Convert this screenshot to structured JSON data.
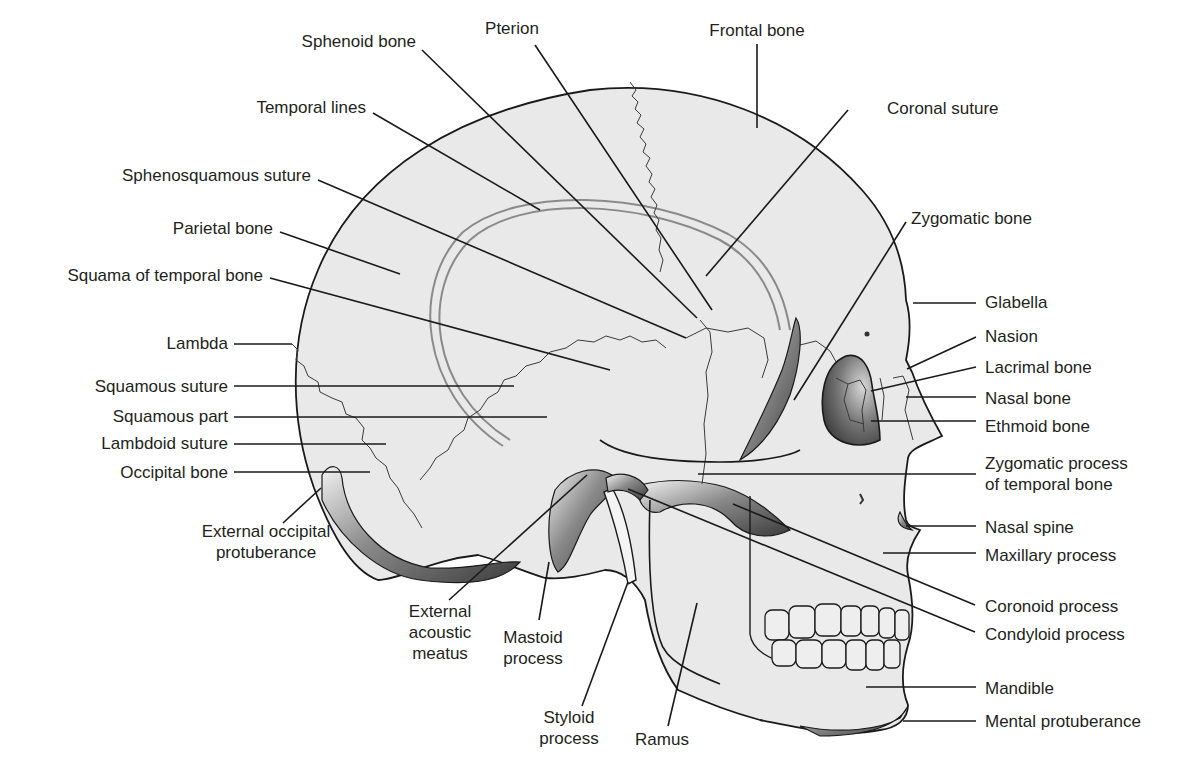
{
  "diagram": {
    "colors": {
      "bone_fill": "#e9e9e9",
      "outline": "#1a1a1a",
      "shadow": "#3a3a3a",
      "text": "#231f20"
    },
    "labels": [
      {
        "id": "frontal-bone",
        "text": [
          "Frontal bone"
        ],
        "x": 757,
        "y": 36,
        "anchor": "middle",
        "leader": [
          [
            757,
            44
          ],
          [
            757,
            128
          ]
        ]
      },
      {
        "id": "pterion",
        "text": [
          "Pterion"
        ],
        "x": 512,
        "y": 34,
        "anchor": "middle",
        "leader": [
          [
            535,
            45
          ],
          [
            712,
            310
          ]
        ]
      },
      {
        "id": "sphenoid-bone",
        "text": [
          "Sphenoid bone"
        ],
        "x": 416,
        "y": 47,
        "anchor": "end",
        "leader": [
          [
            422,
            50
          ],
          [
            697,
            318
          ]
        ]
      },
      {
        "id": "coronal-suture",
        "text": [
          "Coronal suture"
        ],
        "x": 887,
        "y": 114,
        "anchor": "start",
        "leader": [
          [
            848,
            110
          ],
          [
            706,
            276
          ]
        ]
      },
      {
        "id": "temporal-lines",
        "text": [
          "Temporal lines"
        ],
        "x": 366,
        "y": 113,
        "anchor": "end",
        "leader": [
          [
            373,
            113
          ],
          [
            540,
            210
          ]
        ]
      },
      {
        "id": "sphenosquamous-suture",
        "text": [
          "Sphenosquamous suture"
        ],
        "x": 311,
        "y": 181,
        "anchor": "end",
        "leader": [
          [
            318,
            180
          ],
          [
            686,
            338
          ]
        ]
      },
      {
        "id": "zygomatic-bone",
        "text": [
          "Zygomatic bone"
        ],
        "x": 911,
        "y": 224,
        "anchor": "start",
        "leader": [
          [
            906,
            222
          ],
          [
            794,
            400
          ]
        ]
      },
      {
        "id": "parietal-bone",
        "text": [
          "Parietal bone"
        ],
        "x": 273,
        "y": 234,
        "anchor": "end",
        "leader": [
          [
            280,
            232
          ],
          [
            400,
            274
          ]
        ]
      },
      {
        "id": "squama-temporal",
        "text": [
          "Squama of temporal bone"
        ],
        "x": 263,
        "y": 281,
        "anchor": "end",
        "leader": [
          [
            270,
            278
          ],
          [
            610,
            370
          ]
        ]
      },
      {
        "id": "glabella",
        "text": [
          "Glabella"
        ],
        "x": 985,
        "y": 308,
        "anchor": "start",
        "leader": [
          [
            976,
            303
          ],
          [
            913,
            303
          ]
        ]
      },
      {
        "id": "nasion",
        "text": [
          "Nasion"
        ],
        "x": 985,
        "y": 342,
        "anchor": "start",
        "leader": [
          [
            976,
            337
          ],
          [
            907,
            369
          ]
        ]
      },
      {
        "id": "lambda",
        "text": [
          "Lambda"
        ],
        "x": 228,
        "y": 349,
        "anchor": "end",
        "leader": [
          [
            234,
            344
          ],
          [
            292,
            344
          ]
        ]
      },
      {
        "id": "lacrimal-bone",
        "text": [
          "Lacrimal bone"
        ],
        "x": 985,
        "y": 373,
        "anchor": "start",
        "leader": [
          [
            976,
            367
          ],
          [
            871,
            391
          ]
        ]
      },
      {
        "id": "squamous-suture",
        "text": [
          "Squamous suture"
        ],
        "x": 228,
        "y": 392,
        "anchor": "end",
        "leader": [
          [
            234,
            386
          ],
          [
            514,
            386
          ]
        ]
      },
      {
        "id": "nasal-bone",
        "text": [
          "Nasal bone"
        ],
        "x": 985,
        "y": 404,
        "anchor": "start",
        "leader": [
          [
            976,
            397
          ],
          [
            906,
            397
          ]
        ]
      },
      {
        "id": "squamous-part",
        "text": [
          "Squamous part"
        ],
        "x": 228,
        "y": 422,
        "anchor": "end",
        "leader": [
          [
            234,
            417
          ],
          [
            547,
            417
          ]
        ]
      },
      {
        "id": "ethmoid-bone",
        "text": [
          "Ethmoid bone"
        ],
        "x": 985,
        "y": 432,
        "anchor": "start",
        "leader": [
          [
            976,
            421
          ],
          [
            871,
            421
          ]
        ]
      },
      {
        "id": "lambdoid-suture",
        "text": [
          "Lambdoid suture"
        ],
        "x": 228,
        "y": 449,
        "anchor": "end",
        "leader": [
          [
            234,
            444
          ],
          [
            386,
            444
          ]
        ]
      },
      {
        "id": "zygomatic-process",
        "text": [
          "Zygomatic process",
          "of temporal bone"
        ],
        "x": 985,
        "y": 469,
        "anchor": "start",
        "leader": [
          [
            976,
            474
          ],
          [
            698,
            474
          ]
        ]
      },
      {
        "id": "occipital-bone",
        "text": [
          "Occipital bone"
        ],
        "x": 228,
        "y": 478,
        "anchor": "end",
        "leader": [
          [
            234,
            472
          ],
          [
            370,
            472
          ]
        ]
      },
      {
        "id": "external-occipital-protuberance",
        "text": [
          "External occipital",
          "protuberance"
        ],
        "x": 266,
        "y": 537,
        "anchor": "middle",
        "leader": [
          [
            283,
            523
          ],
          [
            321,
            488
          ]
        ]
      },
      {
        "id": "nasal-spine",
        "text": [
          "Nasal spine"
        ],
        "x": 985,
        "y": 533,
        "anchor": "start",
        "leader": [
          [
            976,
            526
          ],
          [
            906,
            526
          ]
        ]
      },
      {
        "id": "maxillary-process",
        "text": [
          "Maxillary process"
        ],
        "x": 985,
        "y": 561,
        "anchor": "start",
        "leader": [
          [
            976,
            553
          ],
          [
            883,
            553
          ]
        ]
      },
      {
        "id": "coronoid-process",
        "text": [
          "Coronoid process"
        ],
        "x": 985,
        "y": 612,
        "anchor": "start",
        "leader": [
          [
            975,
            605
          ],
          [
            733,
            504
          ]
        ]
      },
      {
        "id": "external-acoustic-meatus",
        "text": [
          "External",
          "acoustic",
          "meatus"
        ],
        "x": 440,
        "y": 617,
        "anchor": "middle",
        "leader": [
          [
            449,
            600
          ],
          [
            587,
            475
          ]
        ]
      },
      {
        "id": "mastoid-process",
        "text": [
          "Mastoid",
          "process"
        ],
        "x": 533,
        "y": 643,
        "anchor": "middle",
        "leader": [
          [
            539,
            620
          ],
          [
            549,
            562
          ]
        ]
      },
      {
        "id": "condyloid-process",
        "text": [
          "Condyloid process"
        ],
        "x": 985,
        "y": 640,
        "anchor": "start",
        "leader": [
          [
            975,
            632
          ],
          [
            628,
            489
          ]
        ]
      },
      {
        "id": "styloid-process",
        "text": [
          "Styloid",
          "process"
        ],
        "x": 569,
        "y": 723,
        "anchor": "middle",
        "leader": [
          [
            582,
            706
          ],
          [
            628,
            582
          ]
        ]
      },
      {
        "id": "ramus",
        "text": [
          "Ramus"
        ],
        "x": 662,
        "y": 745,
        "anchor": "middle",
        "leader": [
          [
            668,
            726
          ],
          [
            697,
            603
          ]
        ]
      },
      {
        "id": "mandible",
        "text": [
          "Mandible"
        ],
        "x": 985,
        "y": 694,
        "anchor": "start",
        "leader": [
          [
            976,
            687
          ],
          [
            866,
            687
          ]
        ]
      },
      {
        "id": "mental-protuberance",
        "text": [
          "Mental protuberance"
        ],
        "x": 985,
        "y": 727,
        "anchor": "start",
        "leader": [
          [
            976,
            721
          ],
          [
            903,
            721
          ]
        ]
      }
    ]
  }
}
